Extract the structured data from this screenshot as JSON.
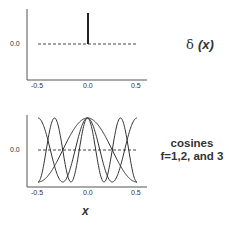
{
  "chart_data": [
    {
      "type": "line",
      "title": "δ (x)",
      "xlabel": "",
      "ylabel": "",
      "xlim": [
        -0.5,
        0.5
      ],
      "x_ticks": [
        "-0.5",
        "0.0",
        "0.5"
      ],
      "y_ticks": [
        "0.0"
      ],
      "series": [
        {
          "name": "delta spike",
          "x": [
            0.0,
            0.0
          ],
          "y": [
            0.0,
            1.0
          ]
        },
        {
          "name": "zero baseline (dashed)",
          "x": [
            -0.5,
            0.5
          ],
          "y": [
            0.0,
            0.0
          ]
        }
      ],
      "grid": false,
      "legend": "none"
    },
    {
      "type": "line",
      "title": "cosines f=1,2, and 3",
      "xlabel": "x",
      "ylabel": "",
      "xlim": [
        -0.5,
        0.5
      ],
      "ylim": [
        -1,
        1
      ],
      "x_ticks": [
        "-0.5",
        "0.0",
        "0.5"
      ],
      "y_ticks": [
        "0.0"
      ],
      "series": [
        {
          "name": "cos(2π·1·x)",
          "frequency": 1
        },
        {
          "name": "cos(2π·2·x)",
          "frequency": 2
        },
        {
          "name": "cos(2π·3·x)",
          "frequency": 3
        },
        {
          "name": "zero baseline (dashed)",
          "x": [
            -0.5,
            0.5
          ],
          "y": [
            0.0,
            0.0
          ]
        }
      ],
      "grid": false,
      "legend": "none"
    }
  ],
  "labels": {
    "delta_symbol": "δ",
    "delta_arg": "(x)",
    "cos_line1": "cosines",
    "cos_line2": "f=1,2, and 3",
    "x_axis": "x",
    "tick_neg": "-0.5",
    "tick_zero": "0.0",
    "tick_pos": "0.5",
    "ytick": "0.0"
  }
}
